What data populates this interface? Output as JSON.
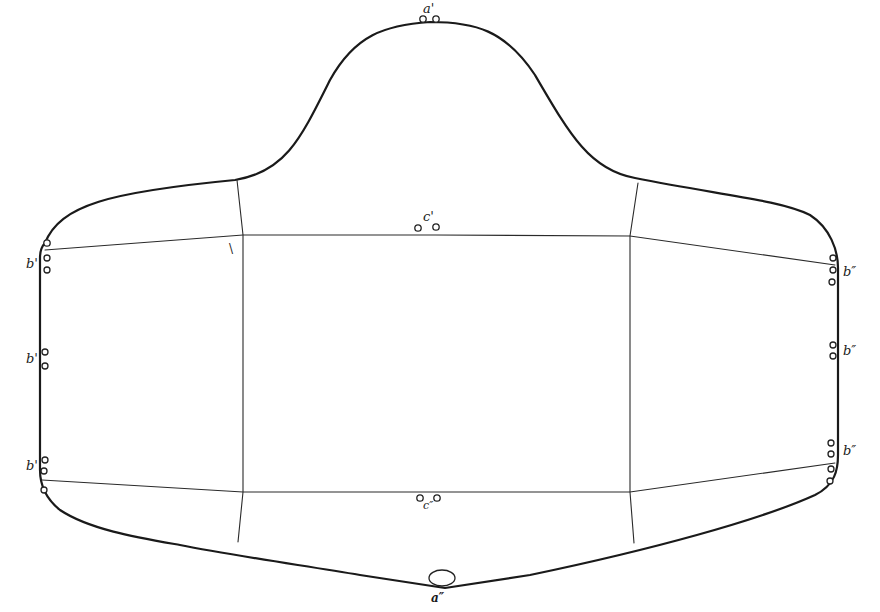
{
  "diagram": {
    "type": "pattern-outline",
    "labels": {
      "top": "a'",
      "bottom": "a″",
      "center_top": "c'",
      "center_bottom": "c″",
      "left_upper": "b'",
      "left_middle": "b'",
      "left_lower": "b'",
      "right_upper": "b″",
      "right_middle": "b″",
      "right_lower": "b″",
      "corner_mark": "\\"
    },
    "colors": {
      "line": "#1a1a1a",
      "background": "#ffffff"
    }
  }
}
